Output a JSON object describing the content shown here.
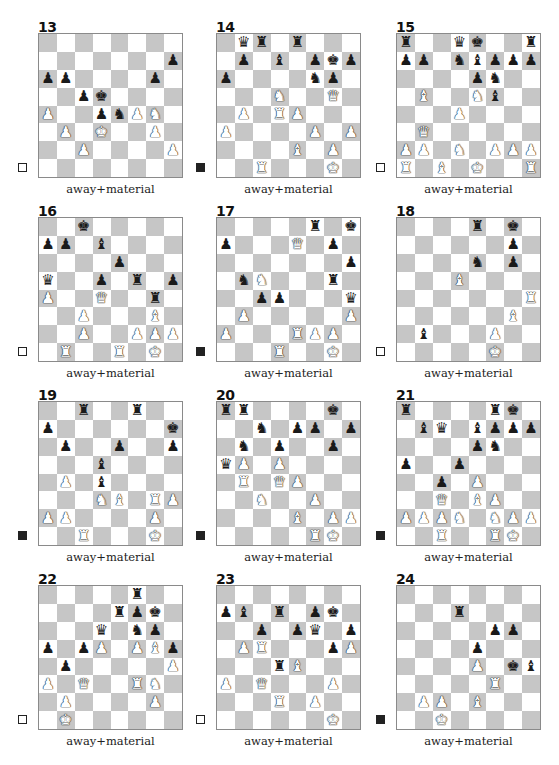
{
  "colors": {
    "light_square": "#ffffff",
    "dark_square": "#c6c6c6",
    "border": "#8a8a8a"
  },
  "pieces_glyphs": {
    "K": "♚",
    "Q": "♛",
    "R": "♜",
    "B": "♝",
    "N": "♞",
    "P": "♟"
  },
  "diagrams": [
    {
      "number": "13",
      "caption": "away+material",
      "to_move": "white",
      "pieces": {
        "h7": "bP",
        "a6": "bP",
        "b6": "bP",
        "g6": "bP",
        "c5": "bP",
        "d5": "bK",
        "a4": "wP",
        "d4": "bP",
        "e4": "bN",
        "f4": "wP",
        "g4": "wN",
        "b3": "wP",
        "d3": "wK",
        "g3": "wP",
        "c2": "wP",
        "h2": "wP"
      }
    },
    {
      "number": "14",
      "caption": "away+material",
      "to_move": "black",
      "pieces": {
        "b8": "bQ",
        "c8": "bR",
        "e8": "bR",
        "b7": "bP",
        "d7": "bB",
        "f7": "bP",
        "g7": "bK",
        "h7": "bP",
        "a6": "bP",
        "f6": "bN",
        "g6": "bP",
        "d5": "wN",
        "g5": "wQ",
        "b4": "wP",
        "d4": "wR",
        "e4": "wP",
        "a3": "wP",
        "f3": "wP",
        "h3": "wP",
        "e2": "wB",
        "g2": "wP",
        "c1": "wR",
        "g1": "wK"
      }
    },
    {
      "number": "15",
      "caption": "away+material",
      "to_move": "white",
      "pieces": {
        "a8": "bR",
        "d8": "bQ",
        "e8": "bK",
        "h8": "bR",
        "a7": "bP",
        "b7": "bP",
        "d7": "bN",
        "e7": "bB",
        "f7": "bP",
        "g7": "bP",
        "h7": "bP",
        "e6": "bP",
        "f6": "bN",
        "b5": "wB",
        "e5": "wN",
        "f5": "bB",
        "d4": "wP",
        "b3": "wQ",
        "a2": "wP",
        "b2": "wP",
        "d2": "wN",
        "f2": "wP",
        "g2": "wP",
        "h2": "wP",
        "a1": "wR",
        "c1": "wB",
        "e1": "wK",
        "h1": "wR"
      }
    },
    {
      "number": "16",
      "caption": "away+material",
      "to_move": "white",
      "pieces": {
        "c8": "bK",
        "a7": "bP",
        "b7": "bP",
        "d7": "bB",
        "e6": "bP",
        "a5": "bQ",
        "d5": "bP",
        "f5": "bR",
        "h5": "bP",
        "a4": "wP",
        "d4": "wQ",
        "g4": "bR",
        "c3": "wP",
        "g3": "wB",
        "c2": "wP",
        "f2": "wP",
        "g2": "wP",
        "h2": "wP",
        "b1": "wR",
        "e1": "wR",
        "g1": "wK"
      }
    },
    {
      "number": "17",
      "caption": "away+material",
      "to_move": "black",
      "pieces": {
        "f8": "bR",
        "h8": "bK",
        "a7": "bP",
        "e7": "wQ",
        "g7": "bP",
        "h6": "bP",
        "b5": "bN",
        "c5": "wN",
        "g5": "bR",
        "c4": "bP",
        "d4": "bP",
        "h4": "bQ",
        "b3": "wP",
        "h3": "wP",
        "a2": "wP",
        "e2": "wR",
        "f2": "wP",
        "g2": "wP",
        "d1": "wR",
        "g1": "wK"
      }
    },
    {
      "number": "18",
      "caption": "away+material",
      "to_move": "white",
      "pieces": {
        "e8": "bR",
        "g8": "bK",
        "g7": "bP",
        "e6": "bN",
        "g6": "bP",
        "d5": "wB",
        "h4": "wR",
        "g3": "wB",
        "b2": "bB",
        "f2": "wP",
        "f1": "wK"
      }
    },
    {
      "number": "19",
      "caption": "away+material",
      "to_move": "black",
      "pieces": {
        "c8": "bR",
        "f8": "bR",
        "a7": "bP",
        "h7": "bK",
        "b6": "bP",
        "e6": "bP",
        "h6": "bP",
        "d5": "bB",
        "b4": "wP",
        "d4": "bB",
        "d3": "wN",
        "e3": "wB",
        "g3": "wR",
        "h3": "wP",
        "a2": "wP",
        "b2": "wP",
        "g2": "wP",
        "c1": "wR",
        "g1": "wK"
      }
    },
    {
      "number": "20",
      "caption": "away+material",
      "to_move": "black",
      "pieces": {
        "a8": "bR",
        "b8": "bR",
        "g8": "bK",
        "c7": "bN",
        "e7": "bP",
        "f7": "bP",
        "h7": "bP",
        "b6": "bN",
        "d6": "bP",
        "g6": "bP",
        "a5": "bQ",
        "b5": "wP",
        "d5": "wP",
        "b4": "wR",
        "d4": "wQ",
        "e4": "wP",
        "c3": "wN",
        "f3": "wP",
        "e2": "wB",
        "g2": "wP",
        "h2": "wP",
        "f1": "wR",
        "g1": "wK"
      }
    },
    {
      "number": "21",
      "caption": "away+material",
      "to_move": "black",
      "pieces": {
        "a8": "bR",
        "f8": "bR",
        "g8": "bK",
        "b7": "bB",
        "c7": "bQ",
        "e7": "bB",
        "f7": "bP",
        "g7": "bP",
        "h7": "bP",
        "e6": "bP",
        "f6": "bN",
        "a5": "bP",
        "d5": "bP",
        "c4": "bP",
        "e4": "wP",
        "c3": "wQ",
        "e3": "wB",
        "f3": "wP",
        "a2": "wP",
        "b2": "wP",
        "c2": "wP",
        "d2": "wN",
        "f2": "wN",
        "g2": "wP",
        "h2": "wP",
        "c1": "wR",
        "f1": "wR",
        "g1": "wK"
      }
    },
    {
      "number": "22",
      "caption": "away+material",
      "to_move": "white",
      "pieces": {
        "f8": "bR",
        "e7": "bR",
        "f7": "bP",
        "g7": "bK",
        "d6": "bQ",
        "f6": "bN",
        "g6": "bP",
        "a5": "bP",
        "c5": "bP",
        "d5": "wP",
        "f5": "wP",
        "g5": "wB",
        "h5": "bP",
        "b4": "bP",
        "h4": "wP",
        "a3": "wP",
        "c3": "wQ",
        "f3": "wR",
        "g3": "wN",
        "b2": "wP",
        "g2": "wP",
        "b1": "wK"
      }
    },
    {
      "number": "23",
      "caption": "away+material",
      "to_move": "white",
      "pieces": {
        "a7": "bP",
        "b7": "bB",
        "d7": "bR",
        "f7": "bP",
        "g7": "bK",
        "c6": "bP",
        "e6": "bP",
        "f6": "bQ",
        "h6": "bP",
        "b5": "wP",
        "c5": "wR",
        "g5": "bP",
        "h5": "wP",
        "d4": "bR",
        "e4": "wB",
        "a3": "wP",
        "c3": "wQ",
        "g3": "wP",
        "d2": "wR",
        "f2": "wP",
        "g1": "wK"
      }
    },
    {
      "number": "24",
      "caption": "away+material",
      "to_move": "black",
      "pieces": {
        "d7": "bR",
        "f6": "bP",
        "g6": "bP",
        "e5": "bP",
        "e4": "wP",
        "g4": "bK",
        "h4": "bB",
        "f3": "wR",
        "b2": "wP",
        "c2": "wP",
        "e2": "wB",
        "c1": "wK"
      }
    }
  ]
}
